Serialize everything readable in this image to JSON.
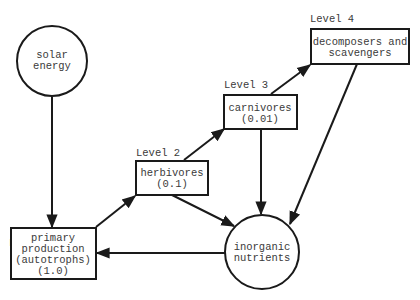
{
  "diagram": {
    "nodes": {
      "solar": {
        "shape": "circle",
        "lines": [
          "solar",
          "energy"
        ]
      },
      "primary": {
        "shape": "box",
        "level_label": "Level 1",
        "lines": [
          "primary",
          "production",
          "(autotrophs)",
          "(1.0)"
        ]
      },
      "herbivores": {
        "shape": "box",
        "level_label": "Level 2",
        "lines": [
          "herbivores",
          "(0.1)"
        ]
      },
      "carnivores": {
        "shape": "box",
        "level_label": "Level 3",
        "lines": [
          "carnivores",
          "(0.01)"
        ]
      },
      "decomposers": {
        "shape": "box",
        "level_label": "Level 4",
        "lines": [
          "decomposers and",
          "scavengers"
        ]
      },
      "inorganic": {
        "shape": "circle",
        "lines": [
          "inorganic",
          "nutrients"
        ]
      }
    },
    "edges": [
      {
        "from": "solar",
        "to": "primary"
      },
      {
        "from": "primary",
        "to": "herbivores"
      },
      {
        "from": "herbivores",
        "to": "carnivores"
      },
      {
        "from": "carnivores",
        "to": "decomposers"
      },
      {
        "from": "herbivores",
        "to": "inorganic"
      },
      {
        "from": "carnivores",
        "to": "inorganic"
      },
      {
        "from": "decomposers",
        "to": "inorganic"
      },
      {
        "from": "inorganic",
        "to": "primary"
      }
    ],
    "colors": {
      "stroke": "#1a1a1a",
      "text": "#3a3a3a",
      "background": "#ffffff"
    }
  }
}
